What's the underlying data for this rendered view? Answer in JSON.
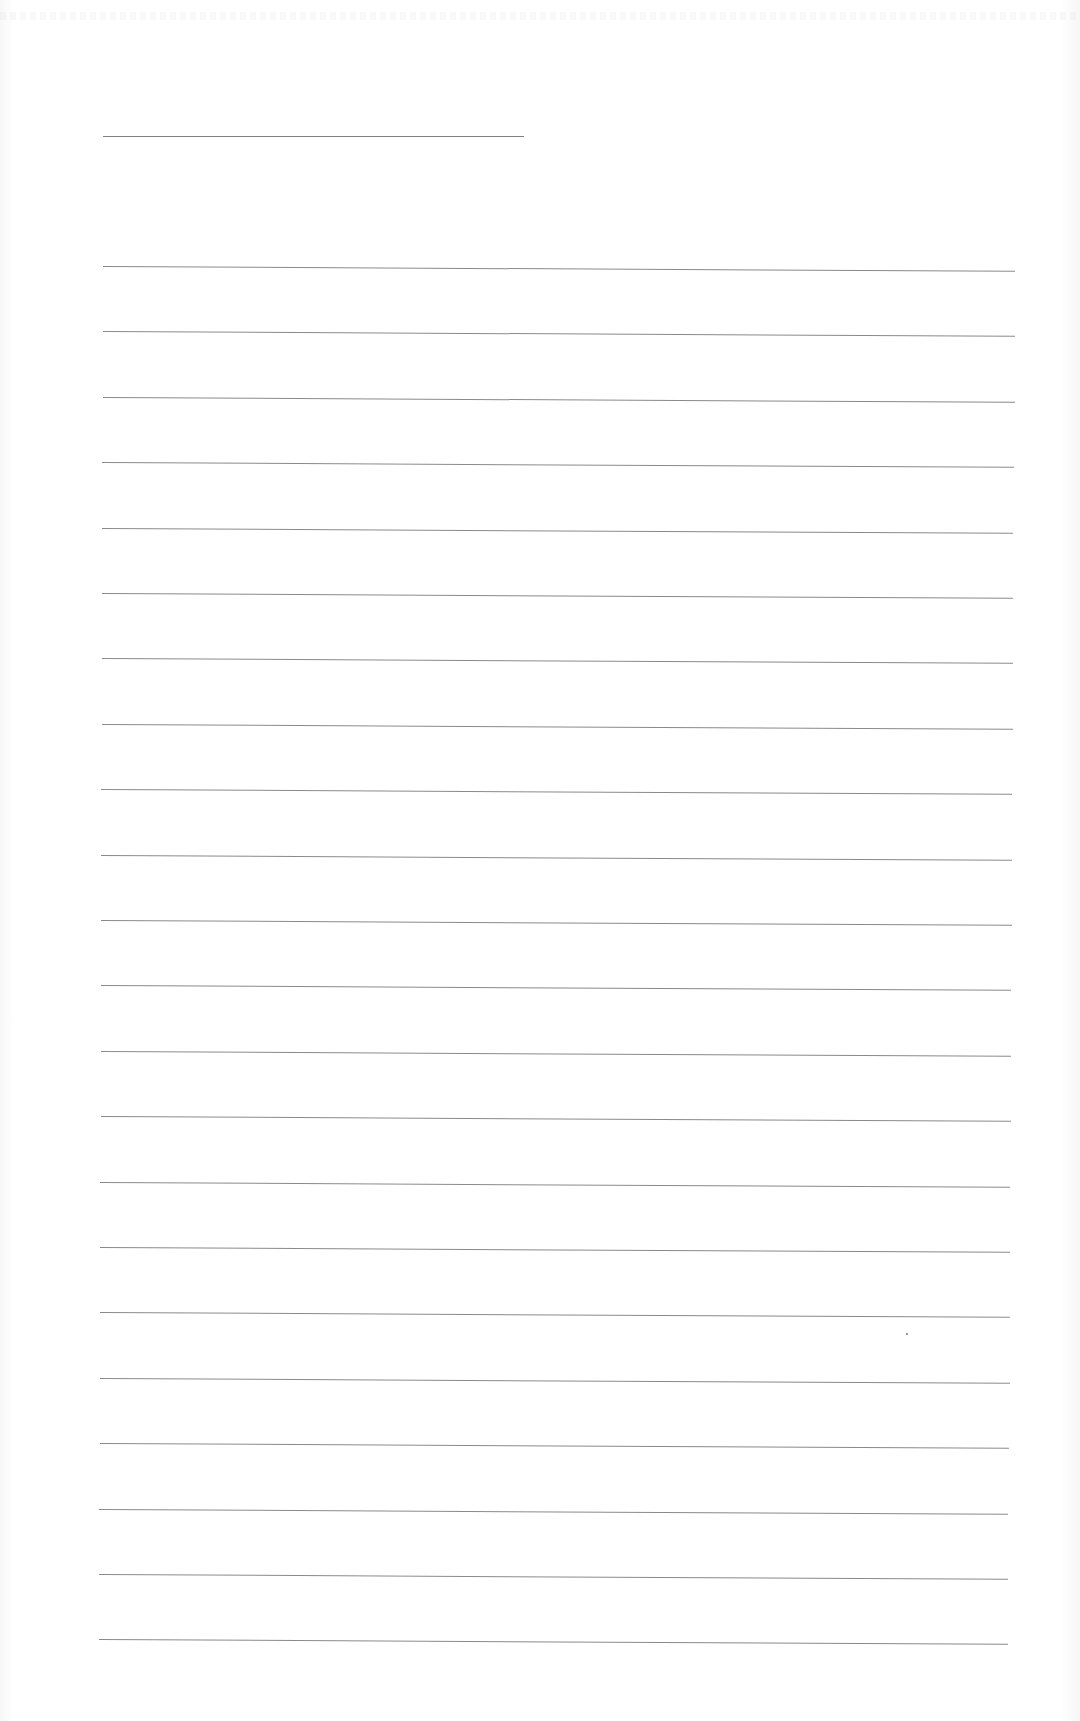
{
  "document": {
    "type": "lined-paper",
    "background_color": "#ffffff",
    "line_color": "#8a8a8a",
    "header_rule": {
      "left": 103,
      "top": 136,
      "width": 421
    },
    "ruled_lines": {
      "count": 22,
      "first_top": 266,
      "spacing": 65.4,
      "left_start": 103,
      "left_end": 99,
      "right_start": 1015,
      "right_end": 1008
    },
    "text": ""
  }
}
